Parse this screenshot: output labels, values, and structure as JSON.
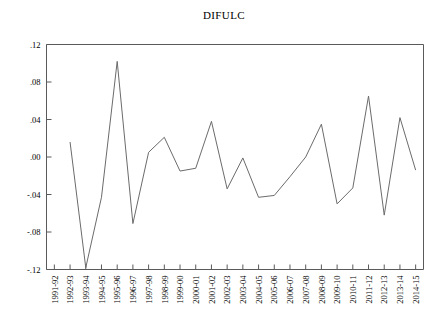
{
  "chart_data": {
    "type": "line",
    "title": "DIFULC",
    "xlabel": "",
    "ylabel": "",
    "grid": false,
    "legend": "none",
    "ylim": [
      -0.12,
      0.12
    ],
    "ytick_labels": [
      ".12",
      ".08",
      ".04",
      ".00",
      "-.04",
      "-.08",
      "-.12"
    ],
    "ytick_values": [
      0.12,
      0.08,
      0.04,
      0.0,
      -0.04,
      -0.08,
      -0.12
    ],
    "categories": [
      "1991-92",
      "1992-93",
      "1993-94",
      "1994-95",
      "1995-96",
      "1996-97",
      "1997-98",
      "1998-99",
      "1999-00",
      "2000-01",
      "2001-02",
      "2002-03",
      "2003-04",
      "2004-05",
      "2005-06",
      "2006-07",
      "2007-08",
      "2008-09",
      "2009-10",
      "2010-11",
      "2011-12",
      "2012-13",
      "2013-14",
      "2014-15"
    ],
    "series": [
      {
        "name": "DIFULC",
        "values": [
          null,
          0.016,
          -0.118,
          -0.043,
          0.102,
          -0.071,
          0.005,
          0.021,
          -0.015,
          -0.012,
          0.038,
          -0.034,
          -0.001,
          -0.043,
          -0.041,
          -0.021,
          0.0,
          0.035,
          -0.05,
          -0.033,
          0.065,
          -0.062,
          0.042,
          -0.014
        ]
      }
    ]
  },
  "axes": {
    "line_color": "#5a5a5a",
    "series_color": "#6b6b6b"
  }
}
